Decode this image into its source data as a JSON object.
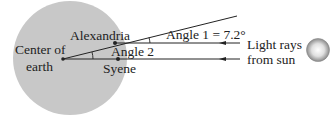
{
  "labels": {
    "center": [
      "Center of",
      "earth"
    ],
    "alexandria": "Alexandria",
    "syene": "Syene",
    "angle1": "Angle 1 = 7.2°",
    "angle2": "Angle 2",
    "light": [
      "Light rays",
      "from sun"
    ]
  },
  "colors": {
    "earth": "#c8c8c8",
    "line": "#222222",
    "text": "#222222"
  },
  "icons": {
    "sun": "sun-icon",
    "earth": "earth-circle"
  }
}
